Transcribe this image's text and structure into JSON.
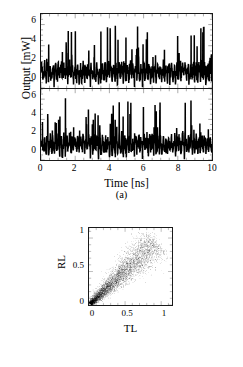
{
  "figure": {
    "background": "#ffffff",
    "ink": "#000000"
  },
  "panel_a": {
    "caption": "(a)",
    "ylabel": "Output [mW]",
    "xlabel": "Time [ns]",
    "ytick_labels": [
      "0",
      "2",
      "4",
      "6"
    ],
    "xtick_labels": [
      "0",
      "2",
      "4",
      "6",
      "8",
      "10"
    ]
  },
  "panel_b": {
    "caption": "(b)",
    "ylabel": "RL",
    "xlabel": "TL",
    "ytick_labels": [
      "0",
      "0.5",
      "1"
    ],
    "xtick_labels": [
      "0",
      "0.5",
      "1"
    ]
  },
  "chart_data": [
    {
      "type": "line",
      "id": "time-series-top",
      "title": "",
      "xlabel": "Time [ns]",
      "ylabel": "Output [mW]",
      "xlim": [
        0,
        10
      ],
      "ylim": [
        0,
        7
      ],
      "xticks": [
        0,
        2,
        4,
        6,
        8,
        10
      ],
      "yticks": [
        0,
        2,
        4,
        6
      ],
      "grid": false,
      "legend": null,
      "series": [
        {
          "name": "output-1",
          "description": "chaotic laser intensity, baseline ~1-2 mW with irregular spikes to 5-6 mW",
          "seed": 20517,
          "n_points": 1400,
          "baseline": 1.5,
          "noise_amplitude": 0.9,
          "spike_probability": 0.07,
          "spike_max": 6.0
        }
      ]
    },
    {
      "type": "line",
      "id": "time-series-bottom",
      "title": "",
      "xlabel": "Time [ns]",
      "ylabel": "Output [mW]",
      "xlim": [
        0,
        10
      ],
      "ylim": [
        0,
        7
      ],
      "xticks": [
        0,
        2,
        4,
        6,
        8,
        10
      ],
      "yticks": [
        0,
        2,
        4,
        6
      ],
      "grid": false,
      "legend": null,
      "series": [
        {
          "name": "output-2",
          "description": "chaotic laser intensity, correlated with output-1, baseline ~1-2 mW with spikes to 6 mW",
          "seed": 78231,
          "n_points": 1400,
          "baseline": 1.5,
          "noise_amplitude": 0.9,
          "spike_probability": 0.07,
          "spike_max": 6.2
        }
      ]
    },
    {
      "type": "scatter",
      "id": "tl-rl-scatter",
      "title": "",
      "xlabel": "TL",
      "ylabel": "RL",
      "xlim": [
        0,
        1.15
      ],
      "ylim": [
        0,
        1.15
      ],
      "xticks": [
        0,
        0.5,
        1
      ],
      "yticks": [
        0,
        0.5,
        1
      ],
      "grid": false,
      "legend": null,
      "description": "dense elongated cloud along the positive diagonal, narrow near origin and fanning out toward (1,1)",
      "n_points": 5200,
      "seed": 4471,
      "marker": "dot",
      "marker_size": 0.55,
      "color": "#000000"
    }
  ]
}
